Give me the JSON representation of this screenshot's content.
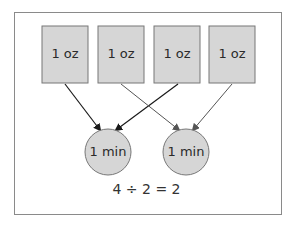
{
  "diagram": {
    "boxes": [
      {
        "label": "1 oz"
      },
      {
        "label": "1 oz"
      },
      {
        "label": "1 oz"
      },
      {
        "label": "1 oz"
      }
    ],
    "circles": [
      {
        "label": "1 min"
      },
      {
        "label": "1 min"
      }
    ],
    "equation": "4 ÷ 2 = 2",
    "colors": {
      "fill": "#d6d6d6",
      "stroke": "#777777",
      "arrow_dark": "#1a1a1a",
      "arrow_gray": "#555555"
    }
  }
}
